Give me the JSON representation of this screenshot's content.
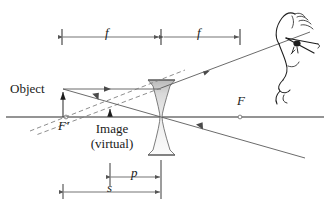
{
  "figure": {
    "type": "optics-ray-diagram",
    "background_color": "#ffffff",
    "ink_color": "#1a1a1a",
    "ray_color": "#5a5a5a",
    "lens_fill_top": "#cfcfcf",
    "lens_fill_bottom": "#f2f2f2"
  },
  "labels": {
    "object": "Object",
    "image_line1": "Image",
    "image_line2": "(virtual)",
    "focal_left": "F'",
    "focal_right": "F",
    "dim_f_left": "f",
    "dim_f_right": "f",
    "dim_p": "p",
    "dim_s": "s"
  },
  "geometry": {
    "axis_y": 117,
    "lens_center_x": 161,
    "lens_top_y": 80,
    "lens_bottom_y": 155,
    "object_x": 63,
    "object_top_y": 89,
    "image_x": 110,
    "image_top_y": 106,
    "focal_left_x": 66,
    "focal_right_x": 240,
    "dim_f_left_from": 62,
    "dim_f_left_to": 160,
    "dim_f_right_from": 163,
    "dim_f_right_to": 240,
    "dim_f_y": 37,
    "dim_p_from": 110,
    "dim_p_to": 161,
    "dim_p_y": 177,
    "dim_s_from": 63,
    "dim_s_to": 161,
    "dim_s_y": 192
  },
  "elements": {
    "eye_figure": "profile-face-with-eye",
    "arrowheads": "solid-triangle",
    "dashed_style": "construction-ray"
  }
}
